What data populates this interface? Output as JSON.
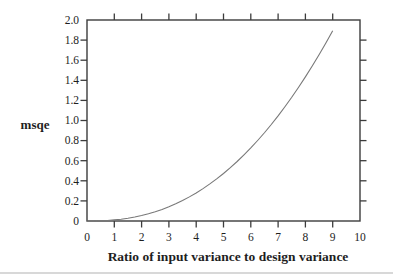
{
  "page": {
    "background": "#ffffff",
    "separator_color": "#d8d8d8"
  },
  "chart_data": {
    "type": "line",
    "title": "",
    "xlabel": "Ratio of input variance to design variance",
    "ylabel": "msqe",
    "xlim": [
      0,
      10
    ],
    "ylim": [
      0,
      2.0
    ],
    "grid": false,
    "frame": "closed box with outward tick marks on all four sides",
    "legend": "none",
    "x_ticks": [
      0,
      1,
      2,
      3,
      4,
      5,
      6,
      7,
      8,
      9,
      10
    ],
    "x_tick_labels": [
      "0",
      "1",
      "2",
      "3",
      "4",
      "5",
      "6",
      "7",
      "8",
      "9",
      "10"
    ],
    "y_ticks": [
      0,
      0.2,
      0.4,
      0.6,
      0.8,
      1.0,
      1.2,
      1.4,
      1.6,
      1.8,
      2.0
    ],
    "y_tick_labels": [
      "0",
      "0.2",
      "0.4",
      "0.6",
      "0.8",
      "1.0",
      "1.2",
      "1.4",
      "1.6",
      "1.8",
      "2.0"
    ],
    "series": [
      {
        "name": "msqe",
        "x": [
          0,
          0.25,
          0.5,
          0.75,
          1,
          1.25,
          1.5,
          1.75,
          2,
          2.25,
          2.5,
          2.75,
          3,
          3.25,
          3.5,
          3.75,
          4,
          4.25,
          4.5,
          4.75,
          5,
          5.25,
          5.5,
          5.75,
          6,
          6.25,
          6.5,
          6.75,
          7,
          7.25,
          7.5,
          7.75,
          8,
          8.25,
          8.5,
          8.75,
          9
        ],
        "y": [
          0,
          0.0,
          0.002,
          0.005,
          0.011,
          0.018,
          0.028,
          0.04,
          0.054,
          0.072,
          0.092,
          0.115,
          0.142,
          0.171,
          0.204,
          0.24,
          0.279,
          0.322,
          0.369,
          0.419,
          0.473,
          0.531,
          0.592,
          0.658,
          0.727,
          0.801,
          0.878,
          0.96,
          1.046,
          1.137,
          1.231,
          1.331,
          1.434,
          1.542,
          1.655,
          1.772,
          1.893
        ]
      }
    ],
    "colors": {
      "frame": "#3c3c3c",
      "curve": "#787878",
      "text": "#1e1e1e"
    }
  }
}
